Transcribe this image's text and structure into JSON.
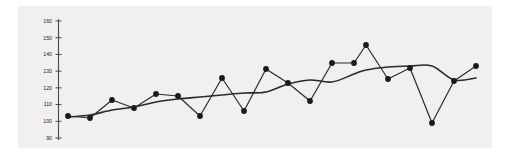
{
  "figure": {
    "background_color": "#ffffff",
    "plot_background_color": "#f0f0f0",
    "line_color": "#2b2b2b",
    "marker_color": "#1a1a1a",
    "axis_color": "#4a4a4a"
  },
  "axis": {
    "y_tick_labels": [
      "160",
      "150",
      "140",
      "130",
      "120",
      "110",
      "100",
      "90"
    ],
    "y_tick_values": [
      160,
      150,
      140,
      130,
      120,
      110,
      100,
      90
    ]
  },
  "chart_data": {
    "type": "line",
    "title": "",
    "subtitle": "",
    "xlabel": "",
    "ylabel": "",
    "xlim": [
      0,
      26
    ],
    "ylim": [
      90,
      160
    ],
    "grid": false,
    "legend": false,
    "x": [
      1,
      2,
      3,
      4,
      5,
      6,
      7,
      8,
      9,
      10,
      11,
      12,
      13,
      14,
      15,
      16,
      17,
      18,
      19,
      20,
      21,
      22,
      23,
      24,
      25
    ],
    "series": [
      {
        "name": "observed",
        "style": "line-with-markers",
        "marker": "circle",
        "values": [
          106,
          105,
          112,
          108,
          114,
          113,
          105,
          120,
          107,
          131,
          125,
          115,
          137,
          137,
          145,
          119,
          133,
          100,
          119,
          134,
          null,
          null,
          null,
          null,
          null
        ]
      },
      {
        "name": "trend",
        "style": "smooth-line",
        "marker": "none",
        "values": [
          106,
          106.5,
          108,
          109,
          110.5,
          112,
          112.5,
          114,
          115,
          116.5,
          119.5,
          121,
          120.5,
          124,
          125,
          128,
          131,
          133,
          133,
          133,
          null,
          null,
          null,
          null,
          null
        ]
      }
    ],
    "series_points": {
      "observed_px": [
        [
          68,
          116
        ],
        [
          90,
          118
        ],
        [
          112,
          100
        ],
        [
          134,
          108
        ],
        [
          156,
          94
        ],
        [
          178,
          96
        ],
        [
          200,
          116
        ],
        [
          222,
          78
        ],
        [
          244,
          111
        ],
        [
          266,
          69
        ],
        [
          288,
          83
        ],
        [
          310,
          101
        ],
        [
          332,
          63
        ],
        [
          354,
          63
        ],
        [
          366,
          45
        ],
        [
          388,
          79
        ],
        [
          410,
          68
        ],
        [
          432,
          123
        ],
        [
          454,
          81
        ],
        [
          476,
          66
        ]
      ],
      "trend_px": [
        [
          68,
          117
        ],
        [
          90,
          115
        ],
        [
          112,
          110
        ],
        [
          134,
          107
        ],
        [
          156,
          102
        ],
        [
          178,
          99
        ],
        [
          200,
          97
        ],
        [
          222,
          95
        ],
        [
          244,
          93
        ],
        [
          266,
          92
        ],
        [
          288,
          84
        ],
        [
          310,
          80
        ],
        [
          332,
          82
        ],
        [
          354,
          74
        ],
        [
          366,
          70
        ],
        [
          388,
          67
        ],
        [
          410,
          66
        ],
        [
          432,
          66
        ],
        [
          454,
          80
        ],
        [
          476,
          78
        ]
      ]
    },
    "annotations": []
  }
}
